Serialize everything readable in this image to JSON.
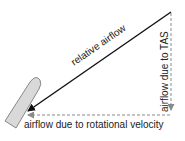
{
  "diagram": {
    "labels": {
      "relative_airflow": "relative airflow",
      "tas": "airflow due to TAS",
      "rotational": "airflow due to rotational velocity"
    },
    "colors": {
      "background": "#ffffff",
      "relative_arrow": "#111111",
      "component_arrows": "#8a8a8a",
      "blade_fill": "#d9d9d9",
      "blade_stroke": "#6e6e6e",
      "text": "#222222"
    }
  }
}
